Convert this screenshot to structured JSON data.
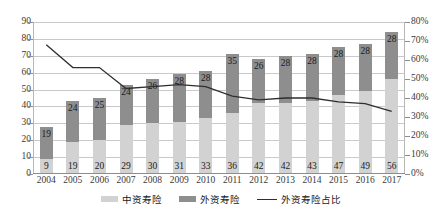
{
  "chart_data": {
    "type": "bar",
    "title": "",
    "subtitle": "",
    "xlabel": "",
    "ylabel": "",
    "y2label": "",
    "grid": true,
    "legend_position": "bottom",
    "categories": [
      "2004",
      "2005",
      "2006",
      "2007",
      "2008",
      "2009",
      "2010",
      "2011",
      "2012",
      "2013",
      "2014",
      "2015",
      "2016",
      "2017"
    ],
    "ylim": [
      0,
      90
    ],
    "yticks": [
      "0",
      "10",
      "20",
      "30",
      "40",
      "50",
      "60",
      "70",
      "80",
      "90"
    ],
    "ytick_values": [
      0,
      10,
      20,
      30,
      40,
      50,
      60,
      70,
      80,
      90
    ],
    "y2lim": [
      0,
      80
    ],
    "y2ticks": [
      "0%",
      "10%",
      "20%",
      "30%",
      "40%",
      "50%",
      "60%",
      "70%",
      "80%"
    ],
    "y2tick_values": [
      0,
      10,
      20,
      30,
      40,
      50,
      60,
      70,
      80
    ],
    "series": [
      {
        "name": "中资寿险",
        "type": "bar-segment-bottom",
        "color": "#d2d2d2",
        "axis": "left",
        "values": [
          9,
          19,
          20,
          29,
          30,
          31,
          33,
          36,
          42,
          42,
          43,
          47,
          49,
          56
        ]
      },
      {
        "name": "外资寿险",
        "type": "bar-segment-top",
        "color": "#8e8e8e",
        "axis": "left",
        "values": [
          19,
          24,
          25,
          24,
          26,
          28,
          28,
          35,
          26,
          28,
          28,
          28,
          28,
          28
        ]
      },
      {
        "name": "外资寿险占比",
        "type": "line",
        "color": "#2e2e2e",
        "axis": "right",
        "values": [
          68,
          56,
          56,
          45,
          46,
          47,
          46,
          41,
          39,
          40,
          40,
          38,
          37,
          33
        ]
      }
    ]
  },
  "legend": {
    "items": [
      {
        "label": "中资寿险",
        "marker": "box",
        "color": "#d2d2d2"
      },
      {
        "label": "外资寿险",
        "marker": "box",
        "color": "#8e8e8e"
      },
      {
        "label": "外资寿险占比",
        "marker": "line",
        "color": "#2e2e2e"
      }
    ]
  }
}
